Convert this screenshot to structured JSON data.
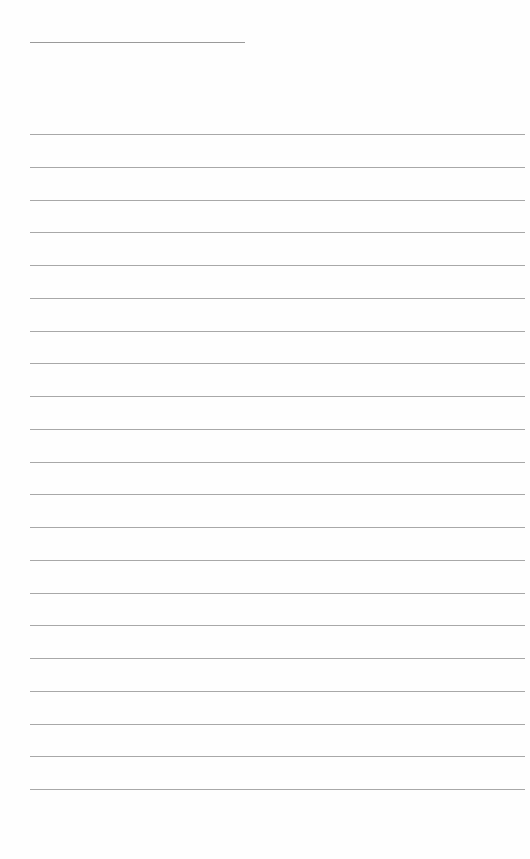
{
  "page": {
    "type": "lined-paper",
    "header_line": {
      "top": 42,
      "left": 30,
      "width": 215
    },
    "ruled_lines": {
      "count": 21,
      "first_top": 134,
      "spacing": 32.75,
      "left": 30,
      "width": 495
    },
    "colors": {
      "background": "#fefefe",
      "line": "#a8a8a8"
    }
  }
}
